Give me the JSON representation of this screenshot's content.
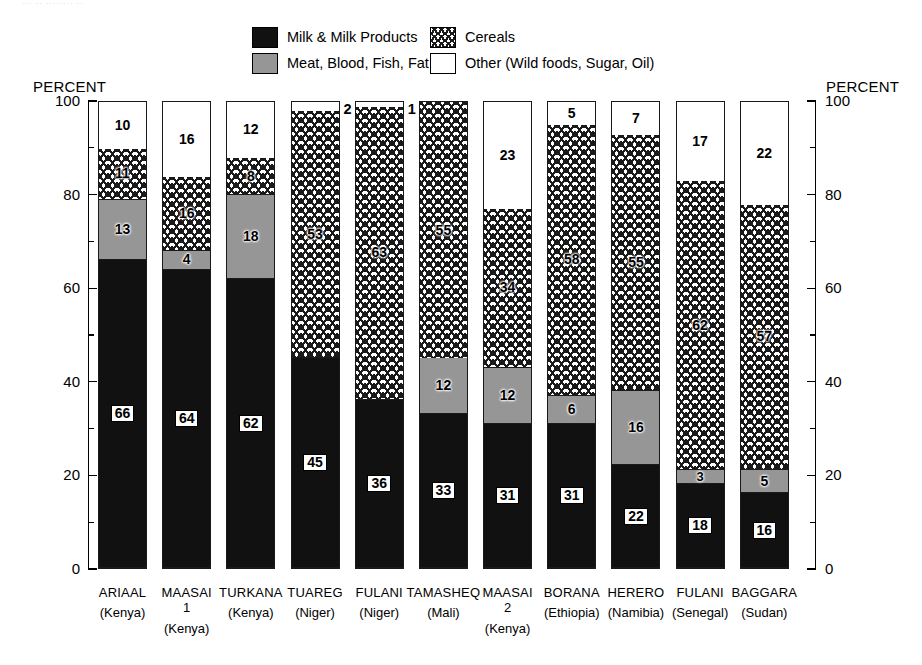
{
  "top_remnant": "··· ·· ········ ··",
  "legend": {
    "items": [
      {
        "key": "milk",
        "label": "Milk & Milk Products",
        "swatch": "milk-swatch"
      },
      {
        "key": "cereal",
        "label": "Cereals",
        "swatch": "cereals-swatch"
      },
      {
        "key": "meat",
        "label": "Meat, Blood, Fish, Fat",
        "swatch": "meat-swatch"
      },
      {
        "key": "other",
        "label": "Other (Wild foods, Sugar, Oil)",
        "swatch": "other-swatch"
      }
    ]
  },
  "axis": {
    "title_left": "PERCENT",
    "title_right": "PERCENT",
    "ticks": [
      "100",
      "80",
      "60",
      "40",
      "20",
      "0"
    ],
    "tick_values": [
      100,
      80,
      60,
      40,
      20,
      0
    ],
    "minor_values": [
      90,
      70,
      50,
      30,
      10
    ]
  },
  "colors": {
    "milk": "#111111",
    "meat": "#969696",
    "cereal": "#ffffff",
    "other": "#ffffff",
    "outline": "#1a1a1a"
  },
  "chart_data": {
    "type": "bar",
    "subtype": "stacked-vertical-100",
    "title": "",
    "xlabel": "",
    "ylabel": "PERCENT",
    "ylim": [
      0,
      100
    ],
    "ytick_step": 20,
    "yminor_step": 10,
    "grid": false,
    "legend_position": "top-center",
    "categories": [
      "ARIAAL",
      "MAASAI 1",
      "TURKANA",
      "TUAREG",
      "FULANI",
      "TAMASHEQ",
      "MAASAI 2",
      "BORANA",
      "HERERO",
      "FULANI",
      "BAGGARA"
    ],
    "category_labels": [
      {
        "name": "ARIAAL",
        "sub": "",
        "country": "(Kenya)"
      },
      {
        "name": "MAASAI",
        "sub": "1",
        "country": "(Kenya)"
      },
      {
        "name": "TURKANA",
        "sub": "",
        "country": "(Kenya)"
      },
      {
        "name": "TUAREG",
        "sub": "",
        "country": "(Niger)"
      },
      {
        "name": "FULANI",
        "sub": "",
        "country": "(Niger)"
      },
      {
        "name": "TAMASHEQ",
        "sub": "",
        "country": "(Mali)"
      },
      {
        "name": "MAASAI",
        "sub": "2",
        "country": "(Kenya)"
      },
      {
        "name": "BORANA",
        "sub": "",
        "country": "(Ethiopia)"
      },
      {
        "name": "HERERO",
        "sub": "",
        "country": "(Namibia)"
      },
      {
        "name": "FULANI",
        "sub": "",
        "country": "(Senegal)"
      },
      {
        "name": "BAGGARA",
        "sub": "",
        "country": "(Sudan)"
      }
    ],
    "series": [
      {
        "name": "Milk & Milk Products",
        "values": [
          66,
          64,
          62,
          45,
          36,
          33,
          31,
          31,
          22,
          18,
          16
        ]
      },
      {
        "name": "Meat, Blood, Fish, Fat",
        "values": [
          13,
          4,
          18,
          0,
          0,
          12,
          12,
          6,
          16,
          3,
          5
        ]
      },
      {
        "name": "Cereals",
        "values": [
          11,
          16,
          8,
          53,
          63,
          55,
          34,
          58,
          55,
          62,
          57
        ]
      },
      {
        "name": "Other (Wild foods, Sugar, Oil)",
        "values": [
          10,
          16,
          12,
          2,
          1,
          0,
          23,
          5,
          7,
          17,
          22
        ]
      }
    ],
    "outside_labels": [
      {
        "category": "TUAREG",
        "value": "2"
      },
      {
        "category": "FULANI (Niger)",
        "value": "1"
      }
    ]
  }
}
